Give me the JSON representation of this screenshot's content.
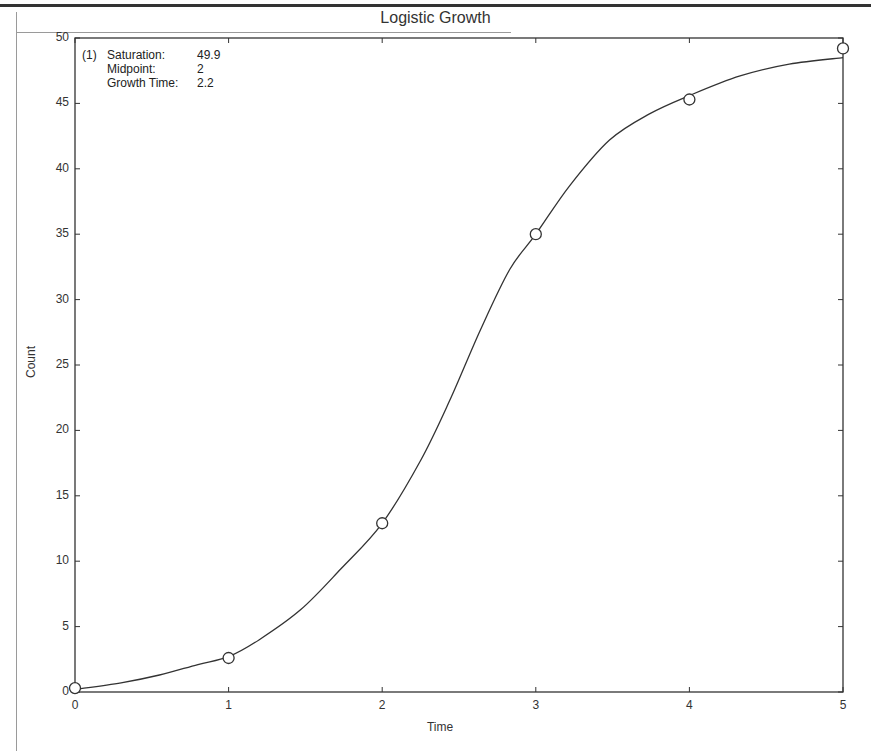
{
  "chart_data": {
    "type": "line",
    "title": "Logistic Growth",
    "xlabel": "Time",
    "ylabel": "Count",
    "xlim": [
      0,
      5
    ],
    "ylim": [
      0,
      50
    ],
    "xticks": [
      "0",
      "1",
      "2",
      "3",
      "4",
      "5"
    ],
    "yticks": [
      "0",
      "5",
      "10",
      "15",
      "20",
      "25",
      "30",
      "35",
      "40",
      "45",
      "50"
    ],
    "grid": false,
    "legend_position": "top-left",
    "series": [
      {
        "name": "Observed",
        "marker": "open-circle",
        "x": [
          0,
          1,
          2,
          3,
          4,
          5
        ],
        "values": [
          0.3,
          2.6,
          12.9,
          35.0,
          45.3,
          49.2
        ]
      },
      {
        "name": "Logistic fit (1)",
        "style": "solid-line",
        "x": [
          0,
          0.3,
          0.55,
          0.8,
          1.0,
          1.2,
          1.47,
          1.73,
          2.0,
          2.25,
          2.44,
          2.64,
          2.83,
          3.0,
          3.22,
          3.48,
          3.74,
          4.0,
          4.33,
          4.65,
          5.0
        ],
        "values": [
          0.2,
          0.7,
          1.3,
          2.1,
          2.7,
          4.0,
          6.3,
          9.4,
          12.9,
          17.7,
          22.3,
          27.7,
          32.3,
          35.0,
          38.7,
          42.2,
          44.2,
          45.6,
          47.1,
          48.0,
          48.5
        ]
      }
    ],
    "annotation": {
      "index": "(1)",
      "params": [
        {
          "label": "Saturation:",
          "value": "49.9"
        },
        {
          "label": "Midpoint:",
          "value": "2"
        },
        {
          "label": "Growth Time:",
          "value": "2.2"
        }
      ]
    }
  }
}
